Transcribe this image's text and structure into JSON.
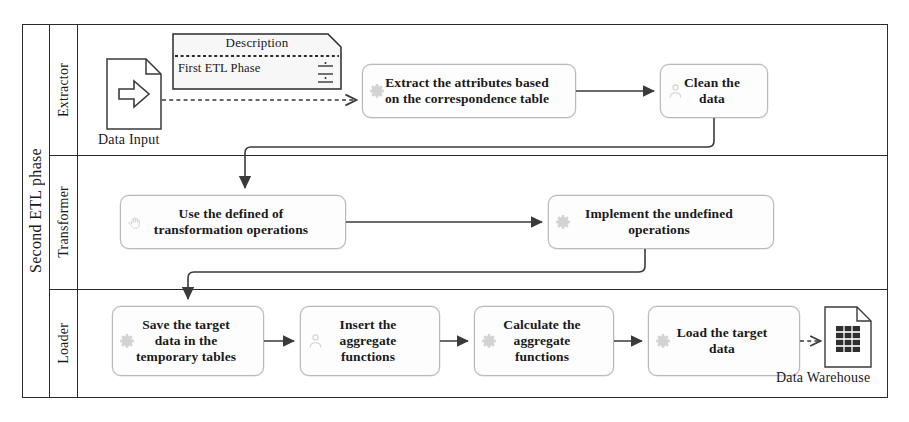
{
  "diagram": {
    "type": "bpmn-pool",
    "pool_label": "Second ETL phase",
    "lanes": [
      {
        "id": "extractor",
        "label": "Extractor"
      },
      {
        "id": "transformer",
        "label": "Transformer"
      },
      {
        "id": "loader",
        "label": "Loader"
      }
    ]
  },
  "annotation": {
    "title": "Description",
    "body": "First ETL Phase",
    "list_icon": "list-lines-icon"
  },
  "data_objects": [
    {
      "id": "data-input",
      "label": "Data Input",
      "icon": "document-arrow-icon"
    },
    {
      "id": "data-warehouse",
      "label": "Data Warehouse",
      "icon": "document-table-icon"
    }
  ],
  "tasks": [
    {
      "id": "extract-attributes",
      "lane": "extractor",
      "icon": "gear-icon",
      "lines": [
        "Extract the attributes based",
        "on the correspondence table"
      ]
    },
    {
      "id": "clean-data",
      "lane": "extractor",
      "icon": "person-icon",
      "lines": [
        "Clean the",
        "data"
      ]
    },
    {
      "id": "use-defined-ops",
      "lane": "transformer",
      "icon": "hand-icon",
      "lines": [
        "Use the defined of",
        "transformation operations"
      ]
    },
    {
      "id": "implement-undefined",
      "lane": "transformer",
      "icon": "gear-icon",
      "lines": [
        "Implement the undefined",
        "operations"
      ]
    },
    {
      "id": "save-target-data",
      "lane": "loader",
      "icon": "gear-icon",
      "lines": [
        "Save the target",
        "data in the",
        "temporary tables"
      ]
    },
    {
      "id": "insert-aggregate",
      "lane": "loader",
      "icon": "person-icon",
      "lines": [
        "Insert the",
        "aggregate",
        "functions"
      ]
    },
    {
      "id": "calculate-aggregate",
      "lane": "loader",
      "icon": "gear-icon",
      "lines": [
        "Calculate the",
        "aggregate",
        "functions"
      ]
    },
    {
      "id": "load-target-data",
      "lane": "loader",
      "icon": "gear-icon",
      "lines": [
        "Load the target",
        "data"
      ]
    }
  ],
  "flows": [
    {
      "from": "data-input",
      "to": "extract-attributes",
      "style": "dashed-association"
    },
    {
      "from": "extract-attributes",
      "to": "clean-data",
      "style": "sequence"
    },
    {
      "from": "clean-data",
      "to": "use-defined-ops",
      "style": "sequence"
    },
    {
      "from": "use-defined-ops",
      "to": "implement-undefined",
      "style": "sequence"
    },
    {
      "from": "implement-undefined",
      "to": "save-target-data",
      "style": "sequence"
    },
    {
      "from": "save-target-data",
      "to": "insert-aggregate",
      "style": "sequence"
    },
    {
      "from": "insert-aggregate",
      "to": "calculate-aggregate",
      "style": "sequence"
    },
    {
      "from": "calculate-aggregate",
      "to": "load-target-data",
      "style": "sequence"
    },
    {
      "from": "load-target-data",
      "to": "data-warehouse",
      "style": "dashed-association"
    }
  ],
  "colors": {
    "frame": "#2b2b2b",
    "task_border": "#b9b9b9",
    "task_fill": "#fdfdfd",
    "connector": "#3a3a3a",
    "icon": "#9a9a9a",
    "page": "#ffffff"
  }
}
